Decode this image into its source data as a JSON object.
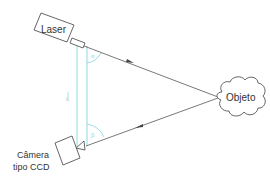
{
  "diagram": {
    "laser": {
      "label": "Laser"
    },
    "camera": {
      "label_line1": "Câmera",
      "label_line2": "tipo CCD"
    },
    "object": {
      "label": "Objeto"
    },
    "baseline": {
      "label": "L"
    },
    "angles": {
      "alpha": "α",
      "beta": "β"
    },
    "colors": {
      "stroke": "#555555",
      "baseline": "#7fd3e0",
      "text": "#333333"
    }
  }
}
